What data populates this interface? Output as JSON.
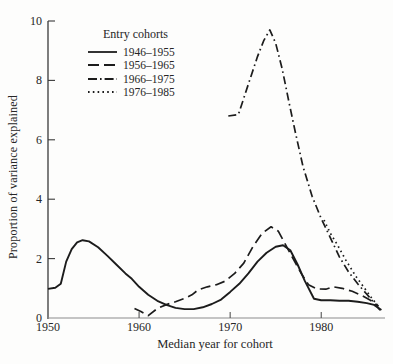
{
  "figure": {
    "background": "#fdfdfc",
    "ink_color": "#1c1c1c",
    "y_axis_color": "#3a3a3a",
    "x_axis_color": "#8c8c8c"
  },
  "chart_data": {
    "type": "line",
    "title": "",
    "legend_title": "Entry cohorts",
    "xlabel": "Median year for cohort",
    "ylabel": "Proportion of variance explained",
    "xlim": [
      1950,
      1987
    ],
    "ylim": [
      0,
      10
    ],
    "x_ticks": [
      1950,
      1960,
      1970,
      1980
    ],
    "y_ticks": [
      0,
      2,
      4,
      6,
      8,
      10
    ],
    "grid": false,
    "legend_position": "upper-left-inside",
    "series": [
      {
        "name": "1946–1955",
        "style": "solid",
        "points": [
          [
            1950,
            0.98
          ],
          [
            1950.8,
            1.02
          ],
          [
            1951.4,
            1.15
          ],
          [
            1952,
            1.9
          ],
          [
            1952.6,
            2.32
          ],
          [
            1953.2,
            2.55
          ],
          [
            1953.8,
            2.62
          ],
          [
            1954.5,
            2.58
          ],
          [
            1955.5,
            2.38
          ],
          [
            1956.5,
            2.1
          ],
          [
            1957.5,
            1.8
          ],
          [
            1958.5,
            1.5
          ],
          [
            1959.2,
            1.32
          ],
          [
            1960,
            1.05
          ],
          [
            1961,
            0.78
          ],
          [
            1962,
            0.58
          ],
          [
            1963,
            0.44
          ],
          [
            1964,
            0.34
          ],
          [
            1965,
            0.3
          ],
          [
            1966,
            0.3
          ],
          [
            1967,
            0.36
          ],
          [
            1968,
            0.47
          ],
          [
            1969,
            0.62
          ],
          [
            1970,
            0.88
          ],
          [
            1971,
            1.15
          ],
          [
            1972,
            1.5
          ],
          [
            1973,
            1.9
          ],
          [
            1974,
            2.2
          ],
          [
            1975,
            2.4
          ],
          [
            1975.8,
            2.45
          ],
          [
            1976.6,
            2.28
          ],
          [
            1977.4,
            1.8
          ],
          [
            1978.2,
            1.25
          ],
          [
            1979.2,
            0.65
          ],
          [
            1980,
            0.6
          ],
          [
            1981,
            0.6
          ],
          [
            1982,
            0.58
          ],
          [
            1983,
            0.58
          ],
          [
            1984,
            0.55
          ],
          [
            1985,
            0.5
          ],
          [
            1985.8,
            0.44
          ],
          [
            1986.6,
            0.27
          ]
        ]
      },
      {
        "name": "1956–1965",
        "style": "dashed",
        "points": [
          [
            1959.5,
            0.32
          ],
          [
            1960.2,
            0.22
          ],
          [
            1961,
            0.08
          ],
          [
            1962,
            0.32
          ],
          [
            1963,
            0.45
          ],
          [
            1964,
            0.55
          ],
          [
            1965,
            0.66
          ],
          [
            1965.8,
            0.78
          ],
          [
            1966.5,
            0.95
          ],
          [
            1967.5,
            1.05
          ],
          [
            1968.5,
            1.12
          ],
          [
            1969.5,
            1.25
          ],
          [
            1970.5,
            1.5
          ],
          [
            1971.5,
            1.85
          ],
          [
            1972.5,
            2.4
          ],
          [
            1973.5,
            2.85
          ],
          [
            1974.5,
            3.07
          ],
          [
            1975.3,
            2.92
          ],
          [
            1976.2,
            2.4
          ],
          [
            1977,
            1.95
          ],
          [
            1977.8,
            1.5
          ],
          [
            1978.6,
            1.12
          ],
          [
            1979.5,
            0.98
          ],
          [
            1980.5,
            0.97
          ],
          [
            1981.3,
            1.05
          ],
          [
            1982.3,
            1.0
          ],
          [
            1983.4,
            0.9
          ],
          [
            1984.5,
            0.75
          ],
          [
            1985.4,
            0.6
          ],
          [
            1986.3,
            0.4
          ]
        ]
      },
      {
        "name": "1966–1975",
        "style": "dashdot",
        "points": [
          [
            1969.8,
            6.8
          ],
          [
            1970.9,
            6.85
          ],
          [
            1971.6,
            7.5
          ],
          [
            1972.3,
            8.15
          ],
          [
            1973,
            8.8
          ],
          [
            1973.7,
            9.35
          ],
          [
            1974.35,
            9.7
          ],
          [
            1975,
            9.25
          ],
          [
            1975.7,
            8.4
          ],
          [
            1976.5,
            7.2
          ],
          [
            1977.2,
            6.2
          ],
          [
            1978,
            5.1
          ],
          [
            1979,
            4.1
          ],
          [
            1980,
            3.35
          ],
          [
            1981,
            2.7
          ],
          [
            1982,
            2.05
          ],
          [
            1983,
            1.55
          ],
          [
            1984,
            1.15
          ],
          [
            1985,
            0.8
          ],
          [
            1985.7,
            0.55
          ],
          [
            1986.5,
            0.25
          ]
        ]
      },
      {
        "name": "1976–1985",
        "style": "dotted",
        "points": [
          [
            1980.3,
            3.3
          ],
          [
            1981,
            2.85
          ],
          [
            1981.8,
            2.45
          ],
          [
            1982.7,
            1.95
          ],
          [
            1983.8,
            1.4
          ],
          [
            1985,
            0.9
          ],
          [
            1985.7,
            0.6
          ],
          [
            1986.2,
            0.45
          ]
        ]
      }
    ]
  }
}
